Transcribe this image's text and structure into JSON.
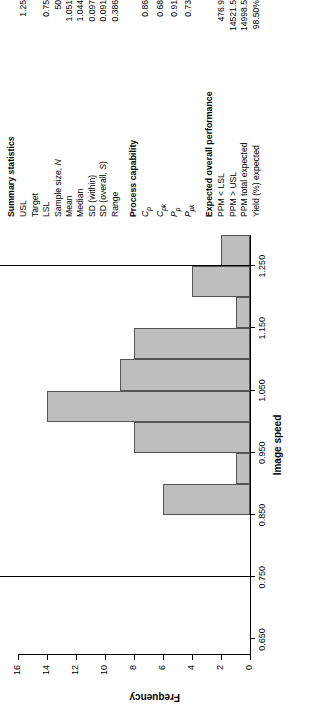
{
  "chart_data": {
    "type": "bar",
    "title": "",
    "xlabel": "Image speed",
    "ylabel": "Frequency",
    "xlim": [
      0.625,
      1.3
    ],
    "ylim": [
      0,
      16
    ],
    "xticks": [
      "0.650",
      "0.750",
      "0.850",
      "0.950",
      "1.050",
      "1.150",
      "1.250"
    ],
    "xtick_values": [
      0.65,
      0.75,
      0.85,
      0.95,
      1.05,
      1.15,
      1.25
    ],
    "yticks": [
      "0",
      "2",
      "4",
      "6",
      "8",
      "10",
      "12",
      "14",
      "16"
    ],
    "ytick_values": [
      0,
      2,
      4,
      6,
      8,
      10,
      12,
      14,
      16
    ],
    "grid": false,
    "legend": "none",
    "bin_edges": [
      0.85,
      0.9,
      0.95,
      1.0,
      1.05,
      1.1,
      1.15,
      1.2,
      1.25,
      1.3
    ],
    "values": [
      6,
      1,
      8,
      14,
      9,
      8,
      1,
      4,
      2
    ],
    "bars": [
      {
        "x0": 0.85,
        "x1": 0.9,
        "f": 6
      },
      {
        "x0": 0.9,
        "x1": 0.95,
        "f": 1
      },
      {
        "x0": 0.95,
        "x1": 1.0,
        "f": 8
      },
      {
        "x0": 1.0,
        "x1": 1.05,
        "f": 14
      },
      {
        "x0": 1.05,
        "x1": 1.1,
        "f": 9
      },
      {
        "x0": 1.1,
        "x1": 1.15,
        "f": 8
      },
      {
        "x0": 1.15,
        "x1": 1.2,
        "f": 1
      },
      {
        "x0": 1.2,
        "x1": 1.25,
        "f": 4
      },
      {
        "x0": 1.25,
        "x1": 1.3,
        "f": 2
      }
    ],
    "annotations": [
      {
        "label": "LSL",
        "value": 0.75
      },
      {
        "label": "USL",
        "value": 1.25
      }
    ],
    "bar_color": "#bebebe",
    "bar_edge_color": "#555555"
  },
  "summary": {
    "title": "Summary statistics",
    "rows": [
      {
        "label": "USL",
        "value": "1.25"
      },
      {
        "label": "Target",
        "value": ""
      },
      {
        "label": "LSL",
        "value": "0.75"
      },
      {
        "label": "Sample size, N",
        "value": "50"
      },
      {
        "label": "Mean",
        "value": "1.051"
      },
      {
        "label": "Median",
        "value": "1.044"
      },
      {
        "label": "SD (within)",
        "value": "0.097"
      },
      {
        "label": "SD (overall, S)",
        "value": "0.091"
      },
      {
        "label": "Range",
        "value": "0.386"
      }
    ]
  },
  "capability": {
    "title": "Process capability",
    "rows": [
      {
        "label": "Cp",
        "value": "0.86"
      },
      {
        "label": "Cpk",
        "value": "0.68"
      },
      {
        "label": "Pp",
        "value": "0.91"
      },
      {
        "label": "Ppk",
        "value": "0.73"
      }
    ]
  },
  "expected": {
    "title": "Expected overall performance",
    "rows": [
      {
        "label": "PPM < LSL",
        "value": "476.9"
      },
      {
        "label": "PPM > USL",
        "value": "14521.5"
      },
      {
        "label": "PPM total expected",
        "value": "14998.5"
      },
      {
        "label": "Yield (%) expected",
        "value": "98.50%"
      }
    ]
  }
}
